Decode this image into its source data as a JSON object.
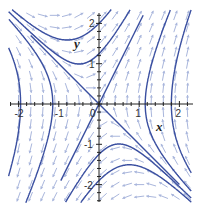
{
  "chart_data": {
    "type": "line",
    "subtype": "phase-portrait-direction-field",
    "title": "",
    "xlabel": "x",
    "ylabel": "y",
    "xlim": [
      -2.2,
      2.3
    ],
    "ylim": [
      -2.4,
      2.3
    ],
    "grid": false,
    "legend": null,
    "x_ticks": [
      -2,
      -1,
      0,
      1,
      2
    ],
    "y_ticks": [
      -2,
      -1,
      1,
      2
    ],
    "x_tick_labels": [
      "-2",
      "-1",
      "0",
      "1",
      "2"
    ],
    "y_tick_labels": [
      "-2",
      "-1",
      "1",
      "2"
    ],
    "system": {
      "dx": "y",
      "dy": "2x + y"
    },
    "equilibrium": [
      0,
      0
    ],
    "separatrices": [
      {
        "name": "unstable manifold",
        "direction": [
          1,
          2
        ],
        "from": [
          -0.95,
          -1.9
        ],
        "to": [
          1.1,
          2.2
        ]
      },
      {
        "name": "stable manifold",
        "direction": [
          1,
          -1
        ],
        "from": [
          -1.7,
          1.7
        ],
        "to": [
          2.0,
          -2.0
        ]
      }
    ],
    "trajectory_seeds": [
      {
        "region": "top",
        "seed": [
          0,
          2.0
        ]
      },
      {
        "region": "top",
        "seed": [
          0,
          1.25
        ]
      },
      {
        "region": "bottom",
        "seed": [
          0,
          -1.25
        ]
      },
      {
        "region": "bottom",
        "seed": [
          0,
          -1.9
        ]
      },
      {
        "region": "right",
        "seed": [
          1.15,
          0
        ]
      },
      {
        "region": "right",
        "seed": [
          1.8,
          0
        ]
      },
      {
        "region": "left",
        "seed": [
          -1.15,
          0
        ]
      },
      {
        "region": "left",
        "seed": [
          -1.95,
          0
        ]
      }
    ],
    "colors": {
      "trajectory": "#3a4fa0",
      "field": "#a9b6dc",
      "axis": "#222222"
    }
  },
  "axes": {
    "x_label": "x",
    "y_label": "y",
    "origin_label": "0"
  }
}
